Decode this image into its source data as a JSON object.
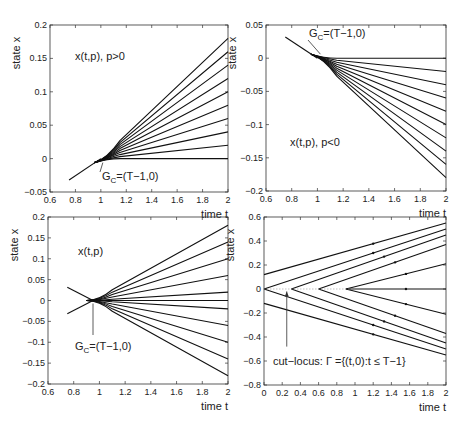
{
  "chart_data": [
    {
      "type": "line",
      "panel": "top-left",
      "title": "",
      "annotation": "x(t,p), p>0",
      "point_label": "G_C=(T−1,0)",
      "xlabel": "time t",
      "ylabel": "state x",
      "xlim": [
        0.6,
        2
      ],
      "ylim": [
        -0.05,
        0.2
      ],
      "xticks": [
        "0.6",
        "0.8",
        "1",
        "1.2",
        "1.4",
        "1.6",
        "1.8",
        "2"
      ],
      "yticks": [
        "-0.05",
        "0",
        "0.05",
        "0.1",
        "0.15",
        "0.2"
      ],
      "grid": false,
      "start": {
        "t": 0.75,
        "x": -0.032
      },
      "merge_point": {
        "t": 1.0,
        "x": 0.0
      },
      "series_endpoints_at_t2": [
        0.18,
        0.16,
        0.14,
        0.12,
        0.1,
        0.08,
        0.06,
        0.04,
        0.02,
        0.0
      ]
    },
    {
      "type": "line",
      "panel": "top-right",
      "title": "",
      "annotation": "x(t,p), p<0",
      "point_label": "G_C=(T−1,0)",
      "xlabel": "time t",
      "ylabel": "state x",
      "xlim": [
        0.6,
        2
      ],
      "ylim": [
        -0.2,
        0.05
      ],
      "xticks": [
        "0.6",
        "0.8",
        "1",
        "1.2",
        "1.4",
        "1.6",
        "1.8",
        "2"
      ],
      "yticks": [
        "-0.2",
        "-0.15",
        "-0.1",
        "-0.05",
        "0",
        "0.05"
      ],
      "grid": false,
      "start": {
        "t": 0.75,
        "x": 0.032
      },
      "merge_point": {
        "t": 1.0,
        "x": 0.0
      },
      "series_endpoints_at_t2": [
        0.0,
        -0.02,
        -0.04,
        -0.06,
        -0.08,
        -0.1,
        -0.12,
        -0.14,
        -0.16,
        -0.18
      ]
    },
    {
      "type": "line",
      "panel": "bottom-left",
      "title": "",
      "annotation": "x(t,p)",
      "point_label": "G_C=(T−1,0)",
      "xlabel": "time t",
      "ylabel": "state x",
      "xlim": [
        0.6,
        2
      ],
      "ylim": [
        -0.2,
        0.2
      ],
      "xticks": [
        "0.6",
        "0.8",
        "1",
        "1.2",
        "1.4",
        "1.6",
        "1.8",
        "2"
      ],
      "yticks": [
        "-0.2",
        "-0.15",
        "-0.1",
        "-0.05",
        "0",
        "0.05",
        "0.1",
        "0.15",
        "0.2"
      ],
      "grid": false,
      "starts": [
        {
          "t": 0.75,
          "x": 0.032
        },
        {
          "t": 0.75,
          "x": -0.032
        }
      ],
      "merge_point": {
        "t": 0.95,
        "x": 0.0
      },
      "series_endpoints_at_t2": [
        0.18,
        0.14,
        0.1,
        0.06,
        0.02,
        0.0,
        -0.02,
        -0.06,
        -0.1,
        -0.14,
        -0.18
      ]
    },
    {
      "type": "line",
      "panel": "bottom-right",
      "title": "",
      "annotation": "cut−locus: Γ ={(t,0):t ≤ T−1}",
      "xlabel": "time t",
      "ylabel": "state x",
      "xlim": [
        0,
        2
      ],
      "ylim": [
        -0.8,
        0.6
      ],
      "xticks": [
        "0",
        "0.2",
        "0.4",
        "0.6",
        "0.8",
        "1",
        "1.2",
        "1.4",
        "1.6",
        "1.8",
        "2"
      ],
      "yticks": [
        "-0.8",
        "-0.6",
        "-0.4",
        "-0.2",
        "0",
        "0.2",
        "0.4",
        "0.6"
      ],
      "grid": false,
      "series": [
        {
          "name": "upper-offset",
          "points": [
            [
              0,
              0.12
            ],
            [
              2,
              0.55
            ]
          ]
        },
        {
          "name": "lower-offset",
          "points": [
            [
              0,
              -0.12
            ],
            [
              2,
              -0.55
            ]
          ]
        },
        {
          "name": "branch-t0-up",
          "points": [
            [
              0,
              0
            ],
            [
              2,
              0.5
            ]
          ]
        },
        {
          "name": "branch-t0-down",
          "points": [
            [
              0,
              0
            ],
            [
              2,
              -0.5
            ]
          ]
        },
        {
          "name": "branch-t0.3-up",
          "points": [
            [
              0.3,
              0
            ],
            [
              2,
              0.45
            ]
          ]
        },
        {
          "name": "branch-t0.3-down",
          "points": [
            [
              0.3,
              0
            ],
            [
              2,
              -0.45
            ]
          ]
        },
        {
          "name": "branch-t0.6-up",
          "points": [
            [
              0.6,
              0
            ],
            [
              2,
              0.37
            ]
          ]
        },
        {
          "name": "branch-t0.6-down",
          "points": [
            [
              0.6,
              0
            ],
            [
              2,
              -0.37
            ]
          ]
        },
        {
          "name": "branch-t0.9-up",
          "points": [
            [
              0.9,
              0
            ],
            [
              2,
              0.21
            ]
          ]
        },
        {
          "name": "branch-t0.9-down",
          "points": [
            [
              0.9,
              0
            ],
            [
              2,
              -0.21
            ]
          ]
        },
        {
          "name": "branch-t0.9-flat",
          "points": [
            [
              0.9,
              0
            ],
            [
              2,
              0
            ]
          ]
        }
      ],
      "cut_locus_line": {
        "points": [
          [
            0,
            0
          ],
          [
            1,
            0
          ]
        ],
        "style": "dotted"
      },
      "arrow_at": {
        "t": 0.25,
        "from_x": -0.48,
        "to_x": -0.02
      }
    }
  ]
}
